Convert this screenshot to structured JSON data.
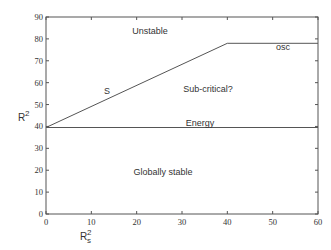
{
  "chart_data": {
    "type": "line",
    "title": "",
    "xlabel": "R_s^2",
    "ylabel": "R^2",
    "xlim": [
      0,
      60
    ],
    "ylim": [
      0,
      90
    ],
    "grid": false,
    "legend": "none",
    "x_ticks": [
      0,
      10,
      20,
      30,
      40,
      50,
      60
    ],
    "y_ticks": [
      0,
      10,
      20,
      30,
      40,
      50,
      60,
      70,
      80,
      90
    ],
    "series": [
      {
        "name": "S",
        "x": [
          0,
          40,
          60
        ],
        "y": [
          39.5,
          78,
          78
        ]
      },
      {
        "name": "Energy",
        "x": [
          0,
          60
        ],
        "y": [
          39.5,
          39.5
        ]
      }
    ],
    "annotations": [
      {
        "text": "Unstable",
        "x": 23,
        "y": 84
      },
      {
        "text": "osc",
        "x": 52.5,
        "y": 75
      },
      {
        "text": "S",
        "x": 13.5,
        "y": 56
      },
      {
        "text": "Sub-critical?",
        "x": 35.5,
        "y": 59
      },
      {
        "text": "Energy",
        "x": 35.5,
        "y": 42
      },
      {
        "text": "Globally stable",
        "x": 25.5,
        "y": 20
      }
    ]
  },
  "axes": {
    "xlabel_main": "R",
    "xlabel_sup": "2",
    "xlabel_sub": "s",
    "ylabel_main": "R",
    "ylabel_sup": "2"
  },
  "labels": {
    "unstable": "Unstable",
    "osc": "osc",
    "s": "S",
    "subcritical": "Sub-critical?",
    "energy": "Energy",
    "globally_stable": "Globally stable"
  },
  "ticks": {
    "x": [
      "0",
      "10",
      "20",
      "30",
      "40",
      "50",
      "60"
    ],
    "y": [
      "0",
      "10",
      "20",
      "30",
      "40",
      "50",
      "60",
      "70",
      "80",
      "90"
    ]
  }
}
